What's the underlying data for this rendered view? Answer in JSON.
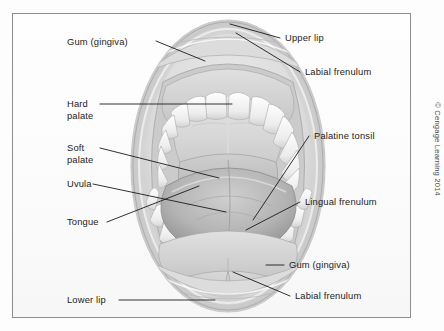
{
  "figure": {
    "copyright": "© Cengage Learning 2014",
    "frame_color": "#8d8d8d",
    "background_color": "#fbfbfb",
    "label_color": "#232323",
    "leader_color": "#1b1b1b"
  },
  "labels": {
    "gum_upper": "Gum (gingiva)",
    "hard_palate_line1": "Hard",
    "hard_palate_line2": "palate",
    "soft_palate_line1": "Soft",
    "soft_palate_line2": "palate",
    "uvula": "Uvula",
    "tongue": "Tongue",
    "lower_lip": "Lower lip",
    "upper_lip": "Upper lip",
    "labial_frenulum_upper": "Labial frenulum",
    "palatine_tonsil": "Palatine tonsil",
    "lingual_frenulum": "Lingual frenulum",
    "gum_lower": "Gum (gingiva)",
    "labial_frenulum_lower": "Labial frenulum"
  },
  "structures": [
    "upper lip",
    "upper gum (gingiva)",
    "upper teeth arch",
    "hard palate",
    "soft palate",
    "uvula",
    "palatine tonsil",
    "oropharynx",
    "tongue",
    "lingual frenulum",
    "lower teeth arch",
    "lower gum (gingiva)",
    "labial frenulum",
    "lower lip"
  ]
}
